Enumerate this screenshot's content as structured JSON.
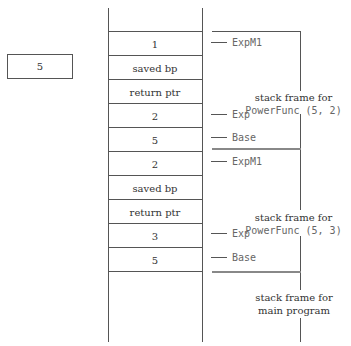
{
  "variable_box": {
    "value": "5"
  },
  "stack": {
    "cells": [
      {
        "text": "1"
      },
      {
        "text": "saved bp"
      },
      {
        "text": "return ptr"
      },
      {
        "text": "2"
      },
      {
        "text": "5"
      },
      {
        "text": "2"
      },
      {
        "text": "saved bp"
      },
      {
        "text": "return ptr"
      },
      {
        "text": "3"
      },
      {
        "text": "5"
      }
    ]
  },
  "labels": [
    {
      "text": "ExpM1"
    },
    {
      "text": "Exp"
    },
    {
      "text": "Base"
    },
    {
      "text": "ExpM1"
    },
    {
      "text": "Exp"
    },
    {
      "text": "Base"
    }
  ],
  "frames": [
    {
      "title": "stack frame for",
      "call": "PowerFunc (5, 2)"
    },
    {
      "title": "stack frame for",
      "call": "PowerFunc (5, 3)"
    },
    {
      "title": "stack frame for",
      "call": "main program"
    }
  ]
}
